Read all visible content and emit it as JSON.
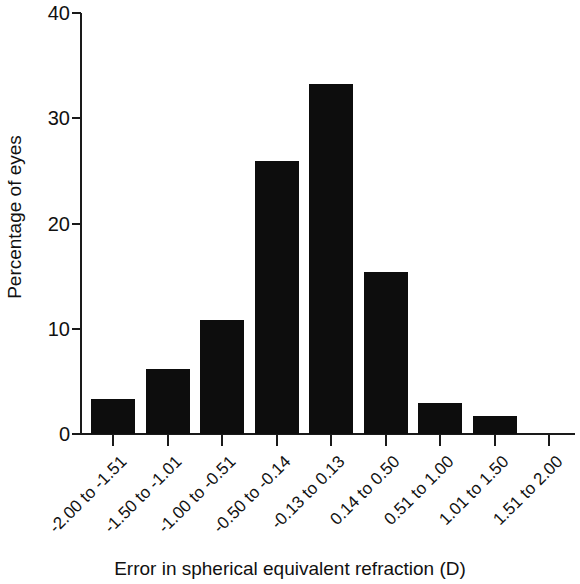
{
  "chart_data": {
    "type": "bar",
    "title": "",
    "xlabel": "Error in spherical equivalent refraction (D)",
    "ylabel": "Percentage of eyes",
    "categories": [
      "-2.00 to -1.51",
      "-1.50 to -1.01",
      "-1.00 to -0.51",
      "-0.50 to -0.14",
      "-0.13 to 0.13",
      "0.14 to 0.50",
      "0.51 to 1.00",
      "1.01 to 1.50",
      "1.51 to 2.00"
    ],
    "values": [
      3.3,
      6.2,
      10.8,
      25.9,
      33.3,
      15.4,
      2.9,
      1.7,
      0
    ],
    "ylim": [
      0,
      40
    ],
    "yticks": [
      0,
      10,
      20,
      30,
      40
    ],
    "ytick_labels": [
      "0",
      "10",
      "20",
      "30",
      "40"
    ],
    "grid": false,
    "legend": null,
    "bar_color": "#0d0d0d",
    "axis_color": "#1a1a1a",
    "background_color": "#ffffff"
  }
}
